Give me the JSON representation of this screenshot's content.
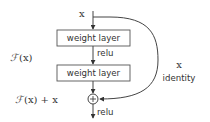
{
  "diagram": {
    "input_label": "x",
    "layers": [
      {
        "label": "weight layer"
      },
      {
        "label": "weight layer"
      }
    ],
    "activation_between": "relu",
    "activation_after": "relu",
    "function_label_script": "ℱ",
    "function_label_rest": "(x)",
    "sum_label_script": "ℱ",
    "sum_label_rest": "(x) + x",
    "shortcut_label": "x",
    "shortcut_caption": "identity",
    "add_symbol": "+",
    "colors": {
      "stroke": "#444444",
      "text": "#333333",
      "background": "#ffffff"
    }
  }
}
